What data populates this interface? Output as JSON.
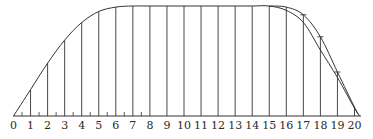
{
  "chart_data": {
    "type": "line",
    "title": "",
    "xlabel": "",
    "ylabel": "",
    "x_ticks": [
      "0",
      "1",
      "2",
      "3",
      "4",
      "5",
      "6",
      "7",
      "8",
      "9",
      "10",
      "11",
      "12",
      "13",
      "14",
      "15",
      "16",
      "17",
      "18",
      "19",
      "20"
    ],
    "half_ticks": [
      0.5,
      1.5,
      2.5,
      3.5,
      4.5,
      5.5,
      6.5,
      7.5
    ],
    "ylim": [
      0,
      1
    ],
    "grid": false,
    "series": [
      {
        "name": "curve (inner run)",
        "x": [
          0,
          1,
          2,
          3,
          4,
          5,
          6,
          7,
          8,
          9,
          10,
          11,
          12,
          13,
          14,
          15,
          16,
          17,
          18,
          19,
          20,
          20.3
        ],
        "values": [
          0.0,
          0.24,
          0.48,
          0.69,
          0.85,
          0.95,
          0.99,
          1.0,
          1.0,
          1.0,
          1.0,
          1.0,
          1.0,
          1.0,
          1.0,
          1.0,
          0.96,
          0.85,
          0.6,
          0.35,
          0.07,
          0.0
        ]
      },
      {
        "name": "curve (outer run)",
        "x": [
          15,
          16,
          17,
          18,
          19,
          20,
          20.3
        ],
        "values": [
          1.0,
          0.99,
          0.92,
          0.72,
          0.4,
          0.08,
          0.0
        ]
      }
    ]
  }
}
